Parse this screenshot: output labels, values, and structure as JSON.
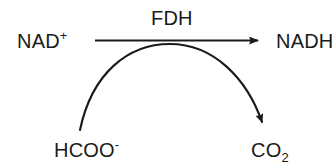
{
  "diagram": {
    "type": "enzymatic-reaction-scheme",
    "background_color": "#ffffff",
    "stroke_color": "#1a1a1a",
    "text_color": "#1a1a1a",
    "enzyme": {
      "name": "FDH",
      "label": "FDH"
    },
    "cofactor_reaction": {
      "substrate": "NAD",
      "substrate_charge": "+",
      "product": "NADH",
      "arrow": "straight-right"
    },
    "substrate_reaction": {
      "substrate": "HCOO",
      "substrate_charge": "-",
      "product": "CO",
      "product_count": "2",
      "arrow": "curved-arc-clockwise"
    }
  }
}
